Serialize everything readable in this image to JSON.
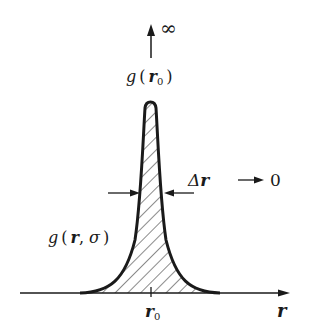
{
  "diagram": {
    "type": "delta-function limit of a peaked distribution",
    "labels": {
      "infinity": "∞",
      "peak_func": "g",
      "peak_open": "(",
      "peak_arg": "r",
      "peak_sub": "0",
      "peak_close": ")",
      "delta_sym": "Δ",
      "delta_var": "r",
      "delta_arrow": "→",
      "delta_limit": "0",
      "curve_func": "g",
      "curve_open": "(",
      "curve_arg1": "r",
      "curve_sep": ",",
      "curve_arg2": "σ",
      "curve_close": ")",
      "tick_var": "r",
      "tick_sub": "0",
      "axis_label": "r"
    },
    "colors": {
      "ink": "#1a1a1a",
      "background": "#ffffff"
    }
  }
}
